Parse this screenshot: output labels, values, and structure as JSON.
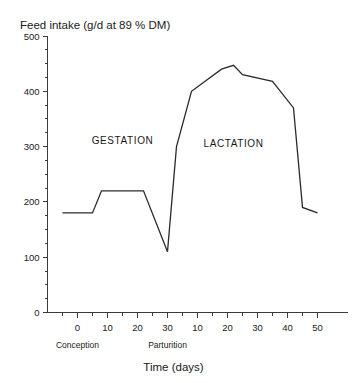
{
  "chart_data": {
    "type": "line",
    "title": "Feed intake (g/d at 89 % DM)",
    "xlabel": "Time (days)",
    "ylabel": "Feed intake (g/d at 89 % DM)",
    "grid": false,
    "legend": "none",
    "ylim": [
      0,
      500
    ],
    "yticks": [
      0,
      100,
      200,
      300,
      400,
      500
    ],
    "ytick_labels": [
      "0",
      "100",
      "200",
      "300",
      "400",
      "500"
    ],
    "yminor_step": 25,
    "xlim": [
      -10,
      55
    ],
    "xticks": [
      0,
      10,
      20,
      30,
      40,
      50,
      60,
      70,
      80
    ],
    "xtick_labels": [
      "0",
      "10",
      "20",
      "30",
      "10",
      "20",
      "30",
      "40",
      "50"
    ],
    "xminor_step": 5,
    "annotations": [
      {
        "text": "GESTATION",
        "x": 15,
        "y": 305
      },
      {
        "text": "LACTATION",
        "x": 52,
        "y": 300
      },
      {
        "text": "Conception",
        "x": 0,
        "axis": "below"
      },
      {
        "text": "Parturition",
        "x": 30,
        "axis": "below"
      }
    ],
    "series": [
      {
        "name": "Feed intake",
        "x": [
          -5,
          5,
          8,
          22,
          30,
          33,
          38,
          48,
          52,
          55,
          65,
          72,
          75,
          80
        ],
        "values": [
          180,
          180,
          220,
          220,
          110,
          300,
          400,
          440,
          447,
          430,
          418,
          370,
          190,
          180
        ]
      }
    ]
  },
  "axis": {
    "title": "Feed intake (g/d at 89 % DM)",
    "xlabel": "Time (days)",
    "ytick_labels": [
      "500",
      "400",
      "300",
      "200",
      "100",
      "0"
    ],
    "xtick_labels": [
      "0",
      "10",
      "20",
      "30",
      "10",
      "20",
      "30",
      "40",
      "50"
    ],
    "event_conception": "Conception",
    "event_parturition": "Parturition",
    "phase_gestation": "GESTATION",
    "phase_lactation": "LACTATION"
  },
  "colors": {
    "line": "#2b2b2b",
    "axis": "#3a3a3a",
    "text": "#1a1a1a",
    "background": "#ffffff"
  }
}
